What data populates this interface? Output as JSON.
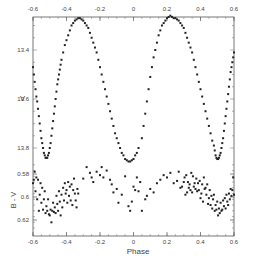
{
  "chart_data": [
    {
      "type": "scatter",
      "panel": "top",
      "title": "",
      "xlabel": "Phase",
      "ylabel": "V",
      "xlim": [
        -0.6,
        0.6
      ],
      "ylim": [
        13.25,
        13.87
      ],
      "y_inverted": true,
      "x_ticks": [
        -0.6,
        -0.4,
        -0.2,
        0,
        0.2,
        0.4,
        0.6
      ],
      "x_tick_labels": [
        "-0.6",
        "-0.4",
        "-0.2",
        "0",
        "0.2",
        "0.4",
        "0.6"
      ],
      "y_ticks": [
        13.4,
        13.6,
        13.8
      ],
      "y_tick_labels": [
        "13.4",
        "13.6",
        "13.8"
      ],
      "grid": false,
      "legend": null,
      "series": [
        {
          "name": "V light curve",
          "x": [
            -0.6,
            -0.595,
            -0.59,
            -0.585,
            -0.58,
            -0.575,
            -0.57,
            -0.565,
            -0.56,
            -0.555,
            -0.55,
            -0.545,
            -0.54,
            -0.535,
            -0.53,
            -0.525,
            -0.52,
            -0.515,
            -0.51,
            -0.505,
            -0.5,
            -0.495,
            -0.49,
            -0.485,
            -0.48,
            -0.475,
            -0.47,
            -0.465,
            -0.46,
            -0.455,
            -0.45,
            -0.445,
            -0.44,
            -0.435,
            -0.43,
            -0.42,
            -0.41,
            -0.4,
            -0.39,
            -0.38,
            -0.37,
            -0.36,
            -0.35,
            -0.34,
            -0.33,
            -0.32,
            -0.31,
            -0.3,
            -0.29,
            -0.28,
            -0.27,
            -0.26,
            -0.25,
            -0.24,
            -0.23,
            -0.22,
            -0.21,
            -0.2,
            -0.19,
            -0.18,
            -0.17,
            -0.16,
            -0.15,
            -0.14,
            -0.13,
            -0.12,
            -0.11,
            -0.1,
            -0.09,
            -0.08,
            -0.07,
            -0.06,
            -0.05,
            -0.04,
            -0.03,
            -0.02,
            -0.01,
            0.0,
            0.01,
            0.02,
            0.03,
            0.05,
            0.06,
            0.07,
            0.08,
            0.09,
            0.1,
            0.11,
            0.12,
            0.13,
            0.14,
            0.15,
            0.16,
            0.17,
            0.18,
            0.19,
            0.2,
            0.21,
            0.22,
            0.23,
            0.24,
            0.25,
            0.26,
            0.27,
            0.28,
            0.29,
            0.3,
            0.31,
            0.32,
            0.33,
            0.34,
            0.35,
            0.36,
            0.37,
            0.38,
            0.39,
            0.4,
            0.41,
            0.42,
            0.43,
            0.44,
            0.45,
            0.46,
            0.47,
            0.48,
            0.485,
            0.49,
            0.495,
            0.5,
            0.505,
            0.51,
            0.515,
            0.52,
            0.525,
            0.53,
            0.535,
            0.54,
            0.545,
            0.55,
            0.555,
            0.56,
            0.565,
            0.57,
            0.575,
            0.58,
            0.585,
            0.59,
            0.595,
            0.6
          ],
          "y": [
            13.47,
            13.5,
            13.53,
            13.56,
            13.59,
            13.61,
            13.64,
            13.67,
            13.7,
            13.73,
            13.76,
            13.78,
            13.8,
            13.82,
            13.83,
            13.84,
            13.84,
            13.84,
            13.83,
            13.82,
            13.8,
            13.78,
            13.75,
            13.72,
            13.69,
            13.66,
            13.63,
            13.6,
            13.57,
            13.54,
            13.52,
            13.5,
            13.48,
            13.46,
            13.44,
            13.41,
            13.38,
            13.36,
            13.34,
            13.32,
            13.3,
            13.29,
            13.28,
            13.275,
            13.27,
            13.27,
            13.275,
            13.28,
            13.29,
            13.3,
            13.31,
            13.33,
            13.35,
            13.37,
            13.39,
            13.41,
            13.44,
            13.47,
            13.5,
            13.53,
            13.56,
            13.59,
            13.62,
            13.65,
            13.68,
            13.71,
            13.74,
            13.76,
            13.78,
            13.8,
            13.82,
            13.83,
            13.845,
            13.85,
            13.855,
            13.855,
            13.85,
            13.845,
            13.83,
            13.82,
            13.8,
            13.76,
            13.71,
            13.66,
            13.61,
            13.56,
            13.51,
            13.47,
            13.43,
            13.4,
            13.37,
            13.34,
            13.32,
            13.3,
            13.29,
            13.28,
            13.27,
            13.265,
            13.26,
            13.265,
            13.27,
            13.27,
            13.275,
            13.28,
            13.29,
            13.3,
            13.31,
            13.33,
            13.35,
            13.37,
            13.39,
            13.41,
            13.44,
            13.47,
            13.5,
            13.53,
            13.56,
            13.59,
            13.62,
            13.65,
            13.68,
            13.71,
            13.74,
            13.77,
            13.79,
            13.81,
            13.83,
            13.84,
            13.845,
            13.845,
            13.84,
            13.83,
            13.82,
            13.8,
            13.78,
            13.76,
            13.73,
            13.7,
            13.67,
            13.64,
            13.61,
            13.58,
            13.55,
            13.52,
            13.49,
            13.47,
            13.45,
            13.43,
            13.41
          ]
        }
      ]
    },
    {
      "type": "scatter",
      "panel": "bottom",
      "title": "",
      "xlabel": "Phase",
      "ylabel": "B - V",
      "xlim": [
        -0.6,
        0.6
      ],
      "ylim": [
        0.5665,
        0.6305
      ],
      "y_inverted": true,
      "x_ticks": [
        -0.6,
        -0.4,
        -0.2,
        0,
        0.2,
        0.4,
        0.6
      ],
      "x_tick_labels": [
        "-0.6",
        "-0.4",
        "-0.2",
        "0",
        "0.2",
        "0.4",
        "0.6"
      ],
      "y_ticks": [
        0.58,
        0.6,
        0.62
      ],
      "y_tick_labels": [
        "0.58",
        "0.6",
        "0.62"
      ],
      "grid": false,
      "legend": null,
      "series": [
        {
          "name": "B-V color",
          "x": [
            -0.6,
            -0.595,
            -0.59,
            -0.585,
            -0.58,
            -0.575,
            -0.57,
            -0.565,
            -0.56,
            -0.555,
            -0.55,
            -0.545,
            -0.54,
            -0.535,
            -0.53,
            -0.525,
            -0.52,
            -0.515,
            -0.51,
            -0.505,
            -0.5,
            -0.495,
            -0.49,
            -0.485,
            -0.48,
            -0.475,
            -0.47,
            -0.465,
            -0.46,
            -0.455,
            -0.45,
            -0.445,
            -0.44,
            -0.435,
            -0.43,
            -0.425,
            -0.42,
            -0.415,
            -0.41,
            -0.405,
            -0.4,
            -0.395,
            -0.39,
            -0.385,
            -0.38,
            -0.375,
            -0.37,
            -0.365,
            -0.36,
            -0.355,
            -0.35,
            -0.345,
            -0.34,
            -0.335,
            -0.33,
            -0.3,
            -0.28,
            -0.26,
            -0.25,
            -0.24,
            -0.22,
            -0.2,
            -0.19,
            -0.18,
            -0.16,
            -0.14,
            -0.13,
            -0.12,
            -0.1,
            -0.09,
            -0.07,
            -0.05,
            -0.03,
            -0.02,
            -0.01,
            0.0,
            0.01,
            0.02,
            0.03,
            0.04,
            0.05,
            0.07,
            0.08,
            0.1,
            0.12,
            0.14,
            0.16,
            0.18,
            0.2,
            0.22,
            0.24,
            0.26,
            0.27,
            0.28,
            0.29,
            0.3,
            0.305,
            0.31,
            0.315,
            0.32,
            0.325,
            0.33,
            0.335,
            0.34,
            0.345,
            0.35,
            0.355,
            0.36,
            0.365,
            0.37,
            0.375,
            0.38,
            0.385,
            0.39,
            0.395,
            0.4,
            0.405,
            0.41,
            0.415,
            0.42,
            0.425,
            0.43,
            0.435,
            0.44,
            0.445,
            0.45,
            0.455,
            0.46,
            0.465,
            0.47,
            0.475,
            0.48,
            0.485,
            0.49,
            0.495,
            0.5,
            0.505,
            0.51,
            0.515,
            0.52,
            0.525,
            0.53,
            0.535,
            0.54,
            0.545,
            0.55,
            0.555,
            0.56,
            0.565,
            0.57,
            0.575,
            0.58,
            0.585,
            0.59,
            0.595,
            0.6
          ],
          "y": [
            0.588,
            0.585,
            0.578,
            0.595,
            0.583,
            0.602,
            0.585,
            0.612,
            0.598,
            0.588,
            0.605,
            0.592,
            0.611,
            0.602,
            0.595,
            0.614,
            0.608,
            0.612,
            0.602,
            0.615,
            0.616,
            0.611,
            0.622,
            0.612,
            0.605,
            0.613,
            0.609,
            0.614,
            0.599,
            0.606,
            0.612,
            0.595,
            0.604,
            0.616,
            0.598,
            0.609,
            0.592,
            0.603,
            0.588,
            0.597,
            0.594,
            0.605,
            0.587,
            0.599,
            0.591,
            0.603,
            0.589,
            0.607,
            0.594,
            0.584,
            0.597,
            0.603,
            0.609,
            0.593,
            0.597,
            0.584,
            0.574,
            0.579,
            0.583,
            0.587,
            0.578,
            0.581,
            0.574,
            0.583,
            0.577,
            0.585,
            0.589,
            0.596,
            0.593,
            0.605,
            0.598,
            0.582,
            0.608,
            0.612,
            0.604,
            0.591,
            0.594,
            0.583,
            0.595,
            0.587,
            0.612,
            0.602,
            0.599,
            0.593,
            0.596,
            0.588,
            0.585,
            0.581,
            0.583,
            0.579,
            0.588,
            0.586,
            0.578,
            0.592,
            0.591,
            0.587,
            0.583,
            0.598,
            0.581,
            0.596,
            0.587,
            0.592,
            0.589,
            0.594,
            0.579,
            0.596,
            0.582,
            0.591,
            0.588,
            0.593,
            0.584,
            0.595,
            0.588,
            0.594,
            0.586,
            0.601,
            0.597,
            0.589,
            0.604,
            0.583,
            0.593,
            0.592,
            0.598,
            0.589,
            0.606,
            0.601,
            0.594,
            0.607,
            0.599,
            0.61,
            0.602,
            0.598,
            0.612,
            0.607,
            0.611,
            0.604,
            0.616,
            0.61,
            0.614,
            0.605,
            0.612,
            0.611,
            0.603,
            0.608,
            0.601,
            0.61,
            0.598,
            0.604,
            0.607,
            0.597,
            0.602,
            0.593,
            0.599,
            0.594,
            0.583,
            0.598,
            0.596,
            0.591
          ]
        }
      ]
    }
  ],
  "labels": {
    "top_x_ticks": [
      "-0.6",
      "-0.4",
      "-0.2",
      "0",
      "0.2",
      "0.4",
      "0.6"
    ],
    "bottom_x_ticks": [
      "-0.6",
      "-0.4",
      "-0.2",
      "0",
      "0.2",
      "0.4",
      "0.6"
    ],
    "v_ticks": [
      "13.4",
      "13.6",
      "13.8"
    ],
    "bv_ticks": [
      "0.58",
      "0.6",
      "0.62"
    ],
    "v_label": "V",
    "bv_label": "B - V",
    "x_label": "Phase"
  },
  "colors": {
    "points": "#222222",
    "axes": "#555555",
    "text": "#444444",
    "background": "#ffffff"
  }
}
